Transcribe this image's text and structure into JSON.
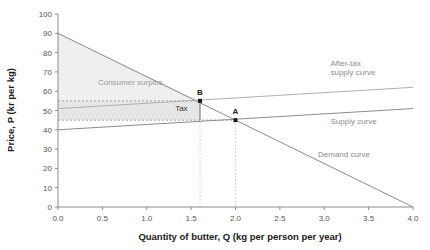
{
  "chart_data": {
    "type": "line",
    "title": "",
    "xlabel": "Quantity of butter, Q (kg per person per year)",
    "ylabel": "Price, P (kr per kg)",
    "xlim": [
      0.0,
      4.0
    ],
    "ylim": [
      0,
      100
    ],
    "xticks": [
      "0.0",
      "0.5",
      "1.0",
      "1.5",
      "2.0",
      "2.5",
      "3.0",
      "3.5",
      "4.0"
    ],
    "xtick_values": [
      0.0,
      0.5,
      1.0,
      1.5,
      2.0,
      2.5,
      3.0,
      3.5,
      4.0
    ],
    "yticks": [
      "0",
      "10",
      "20",
      "30",
      "40",
      "50",
      "60",
      "70",
      "80",
      "90",
      "100"
    ],
    "ytick_values": [
      0,
      10,
      20,
      30,
      40,
      50,
      60,
      70,
      80,
      90,
      100
    ],
    "grid": false,
    "legend_position": "inline-right",
    "series": [
      {
        "name": "Demand curve",
        "label": "Demand curve",
        "x": [
          0.0,
          4.0
        ],
        "values": [
          90,
          0
        ],
        "color": "#8c8c8c",
        "label_x": 2.93,
        "label_y": 26
      },
      {
        "name": "Supply curve",
        "label": "Supply curve",
        "x": [
          0.0,
          4.0
        ],
        "values": [
          40,
          51
        ],
        "color": "#8c8c8c",
        "label_x": 3.07,
        "label_y": 43
      },
      {
        "name": "After-tax supply curve",
        "label_line1": "After-tax",
        "label_line2": "supply curve",
        "x": [
          0.0,
          4.0
        ],
        "values": [
          51,
          62
        ],
        "color": "#b0b0b0",
        "label_x": 3.07,
        "label_y": 73
      }
    ],
    "annotations": [
      {
        "name": "point-b",
        "label": "B",
        "x": 1.6,
        "y": 55,
        "note": "after-tax equilibrium, price paid by consumers"
      },
      {
        "name": "point-a",
        "label": "A",
        "x": 2.0,
        "y": 45,
        "note": "pre-tax equilibrium"
      },
      {
        "name": "consumer-surplus",
        "label": "Consumer surplus",
        "x": 0.45,
        "y": 63
      },
      {
        "name": "tax",
        "label": "Tax",
        "x": 1.32,
        "y": 50
      }
    ],
    "reference_lines": {
      "horizontal": [
        55,
        45
      ],
      "vertical": [
        1.6,
        2.0
      ]
    },
    "shaded_regions": [
      {
        "name": "consumer-surplus-region",
        "fill": "#efefef",
        "vertices": [
          [
            0,
            90
          ],
          [
            1.6,
            55
          ],
          [
            0,
            55
          ]
        ]
      },
      {
        "name": "tax-region",
        "fill": "#e6e6e6",
        "vertices": [
          [
            0,
            55
          ],
          [
            1.6,
            55
          ],
          [
            1.6,
            45
          ],
          [
            0,
            45
          ]
        ]
      }
    ],
    "colors": {
      "axis": "#8c8c8c",
      "curve": "#8c8c8c",
      "after_tax_curve": "#b0b0b0",
      "dashed": "#9a9a9a",
      "dotted_vertical": "#c4c4c4",
      "surplus_fill": "#efefef",
      "tax_fill": "#e6e6e6",
      "text": "#1a1a1a"
    }
  }
}
